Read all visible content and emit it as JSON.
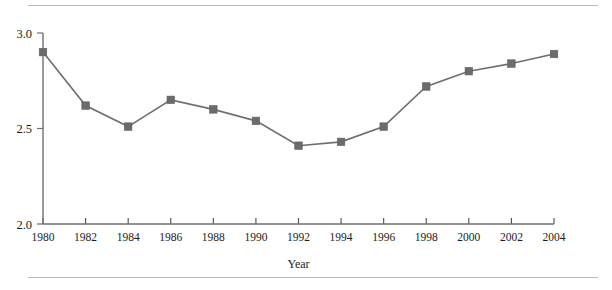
{
  "chart_data": {
    "type": "line",
    "title": "",
    "xlabel": "Year",
    "ylabel": "",
    "categories": [
      1980,
      1982,
      1984,
      1986,
      1988,
      1990,
      1992,
      1994,
      1996,
      1998,
      2000,
      2002,
      2004
    ],
    "values": [
      2.9,
      2.62,
      2.51,
      2.65,
      2.6,
      2.54,
      2.41,
      2.43,
      2.51,
      2.72,
      2.8,
      2.84,
      2.89
    ],
    "xlim": [
      1980,
      2004
    ],
    "ylim": [
      2.0,
      3.0
    ],
    "xticks": [
      "1980",
      "1982",
      "1984",
      "1986",
      "1988",
      "1990",
      "1992",
      "1994",
      "1996",
      "1998",
      "2000",
      "2002",
      "2004"
    ],
    "yticks": [
      "2.0",
      "2.5",
      "3.0"
    ],
    "ytick_values": [
      2.0,
      2.5,
      3.0
    ],
    "grid": false,
    "legend": false,
    "legend_position": "none",
    "marker": "square",
    "series_color": "#6e6e6e",
    "marker_color": "#6b6b6b",
    "axis_color": "#6f6f6f"
  },
  "figure": {
    "rule_color": "#b9b9b9",
    "background": "#ffffff"
  }
}
